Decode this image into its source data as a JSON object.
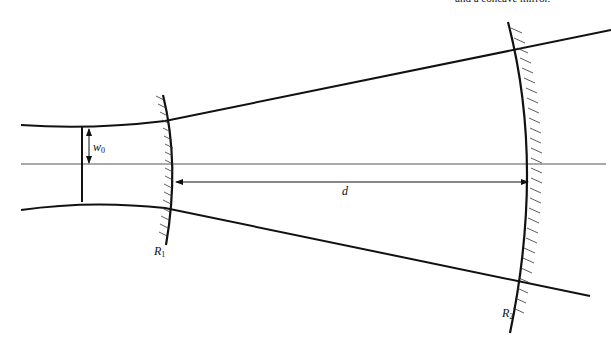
{
  "caption": "and a concave mirror.",
  "labels": {
    "waist": {
      "main": "w",
      "sub": "0"
    },
    "distance": "d",
    "mirror1": {
      "main": "R",
      "sub": "1"
    },
    "mirror2": {
      "main": "R",
      "sub": "2"
    }
  },
  "colors": {
    "ink": "#111111",
    "axis": "#555555"
  }
}
